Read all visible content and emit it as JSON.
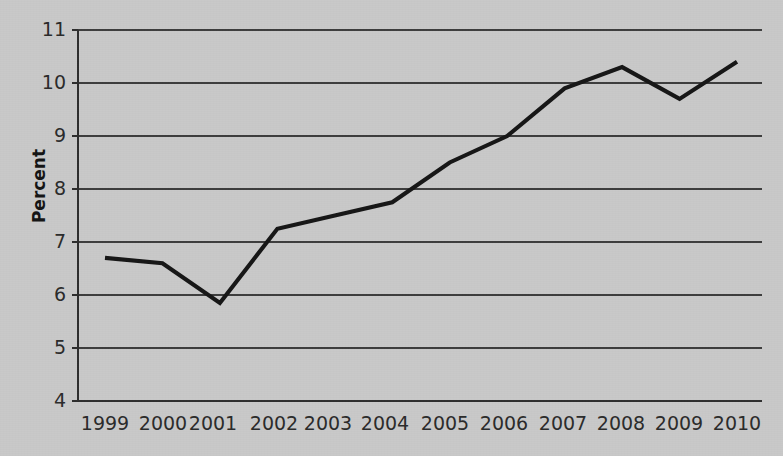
{
  "chart_data": {
    "type": "line",
    "title": "",
    "subtitle": "",
    "xlabel": "",
    "ylabel": "Percent",
    "categories": [
      "1999",
      "2000",
      "2001",
      "2002",
      "2003",
      "2004",
      "2005",
      "2006",
      "2007",
      "2008",
      "2009",
      "2010"
    ],
    "x": [
      1999,
      2000,
      2001,
      2002,
      2003,
      2004,
      2005,
      2006,
      2007,
      2008,
      2009,
      2010
    ],
    "values": [
      6.7,
      6.6,
      5.85,
      7.25,
      7.5,
      7.75,
      8.5,
      9.0,
      9.9,
      10.3,
      9.7,
      10.4
    ],
    "series": [
      {
        "name": "Percent",
        "values": [
          6.7,
          6.6,
          5.85,
          7.25,
          7.5,
          7.75,
          8.5,
          9.0,
          9.9,
          10.3,
          9.7,
          10.4
        ],
        "color": "#161616"
      }
    ],
    "ylim": [
      4,
      11
    ],
    "yticks": [
      4,
      5,
      6,
      7,
      8,
      9,
      10,
      11
    ],
    "ytick_labels": [
      "4",
      "5",
      "6",
      "7",
      "8",
      "9",
      "10",
      "11"
    ],
    "xtick_labels": [
      "1999",
      "2000",
      "2001",
      "2002",
      "2003",
      "2004",
      "2005",
      "2006",
      "2007",
      "2008",
      "2009",
      "2010"
    ],
    "grid": true,
    "grid_axis": "y",
    "legend": false,
    "legend_position": "none",
    "background_color": "#c9c9c9",
    "line_color": "#161616",
    "gridline_color": "#3d3d3d",
    "text_color": "#2b2b2b"
  },
  "axis": {
    "y_title": "Percent"
  }
}
